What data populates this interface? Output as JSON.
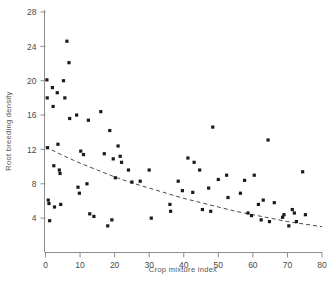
{
  "chart_data": {
    "type": "scatter",
    "title": "",
    "xlabel": "Crop mixture index",
    "ylabel": "Root breeding density",
    "xlim": [
      0,
      80
    ],
    "ylim": [
      0,
      28
    ],
    "xticks": [
      0,
      10,
      20,
      30,
      40,
      50,
      60,
      70,
      80
    ],
    "xtick_labels": [
      "0",
      "10",
      "20",
      "30",
      "40",
      "50",
      "60",
      "70",
      "80"
    ],
    "yticks": [
      4,
      8,
      12,
      16,
      20,
      24,
      28
    ],
    "ytick_labels": [
      "4",
      "8",
      "12",
      "16",
      "20",
      "24",
      "28"
    ],
    "grid": false,
    "legend": "none",
    "marker": "filled-square",
    "marker_color": "#1a1a1a",
    "points": [
      {
        "x": 0.4,
        "y": 20.1
      },
      {
        "x": 0.5,
        "y": 18.0
      },
      {
        "x": 0.6,
        "y": 12.2
      },
      {
        "x": 0.8,
        "y": 6.1
      },
      {
        "x": 1.0,
        "y": 5.7
      },
      {
        "x": 1.2,
        "y": 3.7
      },
      {
        "x": 2.0,
        "y": 19.2
      },
      {
        "x": 2.2,
        "y": 17.0
      },
      {
        "x": 2.4,
        "y": 10.1
      },
      {
        "x": 2.6,
        "y": 5.3
      },
      {
        "x": 3.4,
        "y": 18.6
      },
      {
        "x": 3.6,
        "y": 12.6
      },
      {
        "x": 4.0,
        "y": 9.6
      },
      {
        "x": 4.2,
        "y": 9.2
      },
      {
        "x": 4.4,
        "y": 5.6
      },
      {
        "x": 5.2,
        "y": 20.0
      },
      {
        "x": 5.6,
        "y": 18.0
      },
      {
        "x": 6.2,
        "y": 24.6
      },
      {
        "x": 6.8,
        "y": 22.1
      },
      {
        "x": 7.0,
        "y": 15.6
      },
      {
        "x": 9.0,
        "y": 16.0
      },
      {
        "x": 9.4,
        "y": 7.6
      },
      {
        "x": 9.8,
        "y": 6.9
      },
      {
        "x": 10.2,
        "y": 11.8
      },
      {
        "x": 11.0,
        "y": 11.4
      },
      {
        "x": 12.0,
        "y": 8.0
      },
      {
        "x": 12.4,
        "y": 15.4
      },
      {
        "x": 12.8,
        "y": 4.5
      },
      {
        "x": 14.0,
        "y": 4.2
      },
      {
        "x": 16.0,
        "y": 16.4
      },
      {
        "x": 17.0,
        "y": 11.5
      },
      {
        "x": 18.0,
        "y": 3.1
      },
      {
        "x": 18.6,
        "y": 14.2
      },
      {
        "x": 19.2,
        "y": 3.8
      },
      {
        "x": 19.6,
        "y": 10.9
      },
      {
        "x": 20.2,
        "y": 8.7
      },
      {
        "x": 21.0,
        "y": 12.4
      },
      {
        "x": 21.6,
        "y": 11.2
      },
      {
        "x": 22.0,
        "y": 10.5
      },
      {
        "x": 24.0,
        "y": 9.6
      },
      {
        "x": 25.0,
        "y": 8.2
      },
      {
        "x": 27.4,
        "y": 8.3
      },
      {
        "x": 30.0,
        "y": 9.6
      },
      {
        "x": 30.6,
        "y": 4.0
      },
      {
        "x": 36.0,
        "y": 5.6
      },
      {
        "x": 36.2,
        "y": 4.8
      },
      {
        "x": 38.4,
        "y": 8.3
      },
      {
        "x": 39.6,
        "y": 7.2
      },
      {
        "x": 41.2,
        "y": 11.0
      },
      {
        "x": 42.6,
        "y": 7.0
      },
      {
        "x": 43.0,
        "y": 10.5
      },
      {
        "x": 44.6,
        "y": 9.6
      },
      {
        "x": 45.4,
        "y": 5.0
      },
      {
        "x": 47.2,
        "y": 7.5
      },
      {
        "x": 47.8,
        "y": 4.8
      },
      {
        "x": 48.4,
        "y": 14.6
      },
      {
        "x": 50.0,
        "y": 8.5
      },
      {
        "x": 52.4,
        "y": 9.0
      },
      {
        "x": 52.8,
        "y": 6.4
      },
      {
        "x": 56.4,
        "y": 6.9
      },
      {
        "x": 57.6,
        "y": 8.4
      },
      {
        "x": 58.6,
        "y": 4.6
      },
      {
        "x": 59.6,
        "y": 4.3
      },
      {
        "x": 60.4,
        "y": 9.0
      },
      {
        "x": 61.6,
        "y": 5.6
      },
      {
        "x": 62.4,
        "y": 3.8
      },
      {
        "x": 63.0,
        "y": 6.1
      },
      {
        "x": 64.4,
        "y": 13.1
      },
      {
        "x": 64.8,
        "y": 3.6
      },
      {
        "x": 66.2,
        "y": 5.8
      },
      {
        "x": 68.6,
        "y": 4.1
      },
      {
        "x": 69.0,
        "y": 4.4
      },
      {
        "x": 70.4,
        "y": 3.1
      },
      {
        "x": 71.4,
        "y": 5.0
      },
      {
        "x": 72.0,
        "y": 4.6
      },
      {
        "x": 72.6,
        "y": 3.6
      },
      {
        "x": 74.4,
        "y": 9.4
      },
      {
        "x": 75.2,
        "y": 4.4
      }
    ],
    "fit_curve": {
      "style": "dashed",
      "description": "exponential decay fit",
      "points": [
        {
          "x": 0,
          "y": 12.3
        },
        {
          "x": 5,
          "y": 11.3
        },
        {
          "x": 10,
          "y": 10.4
        },
        {
          "x": 15,
          "y": 9.6
        },
        {
          "x": 20,
          "y": 8.8
        },
        {
          "x": 25,
          "y": 8.1
        },
        {
          "x": 30,
          "y": 7.5
        },
        {
          "x": 35,
          "y": 6.9
        },
        {
          "x": 40,
          "y": 6.3
        },
        {
          "x": 45,
          "y": 5.8
        },
        {
          "x": 50,
          "y": 5.3
        },
        {
          "x": 55,
          "y": 4.8
        },
        {
          "x": 60,
          "y": 4.4
        },
        {
          "x": 65,
          "y": 4.0
        },
        {
          "x": 70,
          "y": 3.6
        },
        {
          "x": 75,
          "y": 3.3
        },
        {
          "x": 80,
          "y": 3.0
        }
      ]
    }
  }
}
